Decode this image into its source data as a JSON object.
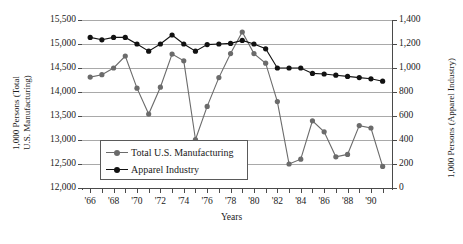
{
  "chart_data": {
    "type": "line",
    "title": "",
    "xlabel": "Years",
    "ylabel_left_line1": "1,000 Persons (Total",
    "ylabel_left_line2": "U.S. Manufacturing)",
    "ylabel_right": "1,000 Persons (Apparel Industry)",
    "grid": true,
    "legend_position": "inside-bottom-left",
    "x": [
      1966,
      1967,
      1968,
      1969,
      1970,
      1971,
      1972,
      1973,
      1974,
      1975,
      1976,
      1977,
      1978,
      1979,
      1980,
      1981,
      1982,
      1983,
      1984,
      1985,
      1986,
      1987,
      1988,
      1989,
      1990,
      1991
    ],
    "xtick_labels": [
      "'66",
      "'68",
      "'70",
      "'72",
      "'74",
      "'76",
      "'78",
      "'80",
      "'82",
      "'84",
      "'86",
      "'88",
      "'90"
    ],
    "xtick_years": [
      1966,
      1968,
      1970,
      1972,
      1974,
      1976,
      1978,
      1980,
      1982,
      1984,
      1986,
      1988,
      1990
    ],
    "xlim": [
      1965.3,
      1991.8
    ],
    "left_axis": {
      "label": "1,000 Persons (Total U.S. Manufacturing)",
      "ylim": [
        12000,
        15500
      ],
      "ticks": [
        12000,
        12500,
        13000,
        13500,
        14000,
        14500,
        15000,
        15500
      ],
      "tick_labels": [
        "12,000",
        "12,500",
        "13,000",
        "13,500",
        "14,000",
        "14,500",
        "15,000",
        "15,500"
      ]
    },
    "right_axis": {
      "label": "1,000 Persons (Apparel Industry)",
      "ylim": [
        0,
        1400
      ],
      "ticks": [
        0,
        200,
        400,
        600,
        800,
        1000,
        1200,
        1400
      ],
      "tick_labels": [
        "0",
        "200",
        "400",
        "600",
        "800",
        "1,000",
        "1,200",
        "1,400"
      ]
    },
    "series": [
      {
        "name": "Total U.S. Manufacturing",
        "axis": "left",
        "color": "#6b6b6b",
        "marker": "circle",
        "values": [
          14310,
          14360,
          14500,
          14750,
          14080,
          13540,
          14100,
          14790,
          14650,
          13010,
          13700,
          14300,
          14800,
          15250,
          14800,
          14600,
          13800,
          12500,
          12600,
          13400,
          13170,
          12650,
          12700,
          13300,
          13250,
          12450
        ]
      },
      {
        "name": "Apparel Industry",
        "axis": "right",
        "color": "#121212",
        "marker": "circle",
        "values": [
          1255,
          1235,
          1255,
          1255,
          1200,
          1140,
          1200,
          1275,
          1200,
          1140,
          1195,
          1200,
          1205,
          1230,
          1200,
          1160,
          1000,
          1000,
          1000,
          955,
          950,
          940,
          930,
          920,
          910,
          890
        ]
      }
    ]
  },
  "legend": {
    "items": [
      {
        "label": "Total U.S. Manufacturing",
        "color": "#6b6b6b"
      },
      {
        "label": "Apparel Industry",
        "color": "#121212"
      }
    ]
  }
}
